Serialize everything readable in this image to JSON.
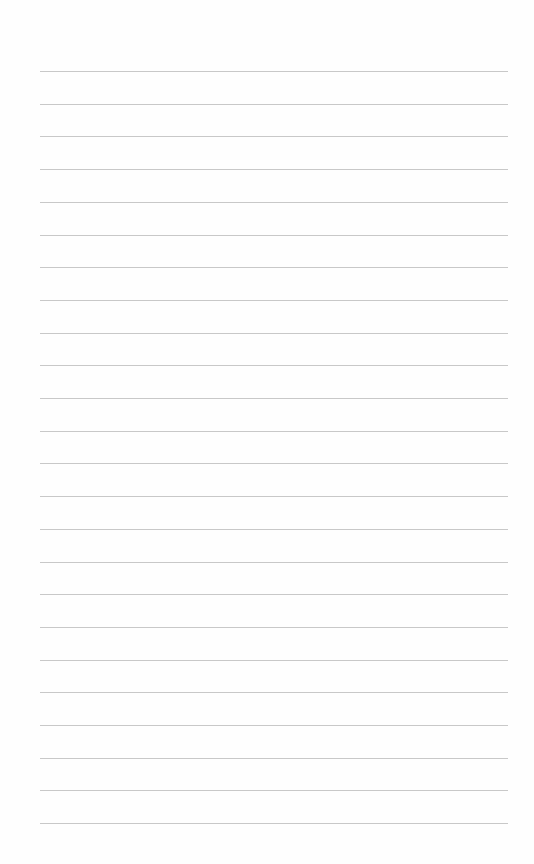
{
  "paper": {
    "type": "lined-paper",
    "line_count": 24,
    "first_line_y": 71,
    "line_spacing": 32.7,
    "line_left": 40,
    "line_width": 468,
    "line_color": "#c8c8c8",
    "background_color": "#fefefe"
  }
}
